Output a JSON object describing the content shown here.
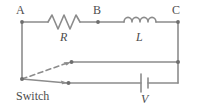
{
  "figure": {
    "name": "rl-circuit-with-switch",
    "background_color": "#ffffff",
    "wire_color": "#8c8c8c",
    "label_color": "#4d4d4d"
  },
  "nodes": {
    "a_label": "A",
    "b_label": "B",
    "c_label": "C"
  },
  "components": {
    "resistor_label": "R",
    "inductor_label": "L",
    "battery_label": "V",
    "switch_label": "Switch"
  }
}
